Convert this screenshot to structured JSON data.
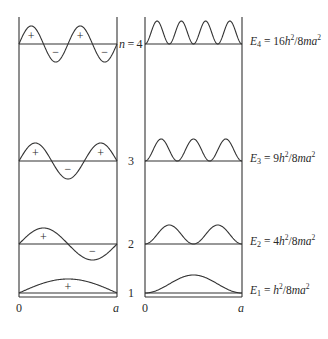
{
  "diagram": {
    "colors": {
      "line": "#333333",
      "text": "#2a2a2a",
      "background": "#ffffff"
    },
    "layout": {
      "box_top": 17,
      "box_bottom": 297,
      "left_panel": {
        "x0": 19,
        "x1": 117
      },
      "right_panel": {
        "x0": 145,
        "x1": 242
      }
    },
    "left_panel": {
      "name": "wavefunction",
      "axis_start_label": "0",
      "axis_end_label": "a"
    },
    "right_panel": {
      "name": "probability-density",
      "axis_start_label": "0",
      "axis_end_label": "a"
    },
    "levels": [
      {
        "n": 4,
        "n_label": "n = 4",
        "baseline_y": 44,
        "psi_amplitude": 18,
        "density_amplitude": 23,
        "signs": [
          "+",
          "−",
          "+",
          "−"
        ],
        "energy": {
          "symbol": "E",
          "sub": "4",
          "coef": "16",
          "h": "h",
          "exp": "2",
          "den": "/8ma",
          "exp2": "2"
        }
      },
      {
        "n": 3,
        "n_label": "3",
        "baseline_y": 161,
        "psi_amplitude": 18,
        "density_amplitude": 22,
        "signs": [
          "+",
          "−",
          "+"
        ],
        "energy": {
          "symbol": "E",
          "sub": "3",
          "coef": "9",
          "h": "h",
          "exp": "2",
          "den": "/8ma",
          "exp2": "2"
        }
      },
      {
        "n": 2,
        "n_label": "2",
        "baseline_y": 244,
        "psi_amplitude": 16,
        "density_amplitude": 19,
        "signs": [
          "+",
          "−"
        ],
        "energy": {
          "symbol": "E",
          "sub": "2",
          "coef": "4",
          "h": "h",
          "exp": "2",
          "den": "/8ma",
          "exp2": "2"
        }
      },
      {
        "n": 1,
        "n_label": "1",
        "baseline_y": 293,
        "psi_amplitude": 14,
        "density_amplitude": 18,
        "signs": [
          "+"
        ],
        "energy": {
          "symbol": "E",
          "sub": "1",
          "coef": "",
          "h": "h",
          "exp": "2",
          "den": "/8ma",
          "exp2": "2"
        }
      }
    ]
  }
}
